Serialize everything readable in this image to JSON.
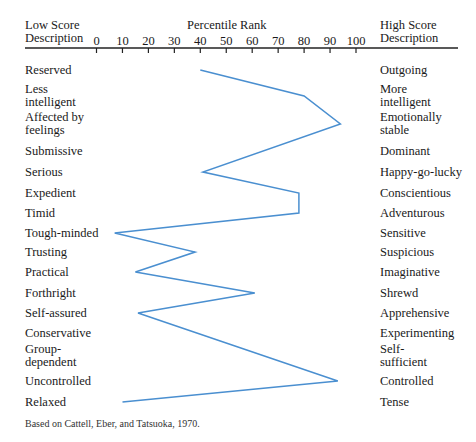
{
  "header": {
    "low_title_1": "Low Score",
    "low_title_2": "Description",
    "center_title": "Percentile Rank",
    "high_title_1": "High  Score",
    "high_title_2": "Description"
  },
  "footnote": "Based on Cattell, Eber, and Tatsuoka, 1970.",
  "chart_data": {
    "type": "line",
    "title": "Percentile Rank",
    "xlabel": "Percentile Rank",
    "ylabel": "",
    "xlim": [
      0,
      100
    ],
    "x_ticks": [
      "0",
      "10",
      "20",
      "30",
      "40",
      "50",
      "60",
      "70",
      "80",
      "90",
      "100"
    ],
    "orientation": "horizontal-profile",
    "grid": false,
    "legend": null,
    "line_color": "#4a8fd0",
    "traits": [
      {
        "low": "Reserved",
        "high": "Outgoing",
        "value": 40
      },
      {
        "low": "Less intelligent",
        "high": "More intelligent",
        "value": 80
      },
      {
        "low": "Affected by feelings",
        "high": "Emotionally stable",
        "value": 94
      },
      {
        "low": "Submissive",
        "high": "Dominant",
        "value": null
      },
      {
        "low": "Serious",
        "high": "Happy-go-lucky",
        "value": 41
      },
      {
        "low": "Expedient",
        "high": "Conscientious",
        "value": 78
      },
      {
        "low": "Timid",
        "high": "Adventurous",
        "value": 78
      },
      {
        "low": "Tough-minded",
        "high": "Sensitive",
        "value": 7
      },
      {
        "low": "Trusting",
        "high": "Suspicious",
        "value": 38
      },
      {
        "low": "Practical",
        "high": "Imaginative",
        "value": 15
      },
      {
        "low": "Forthright",
        "high": "Shrewd",
        "value": 61
      },
      {
        "low": "Self-assured",
        "high": "Apprehensive",
        "value": 16
      },
      {
        "low": "Conservative",
        "high": "Experimenting",
        "value": null
      },
      {
        "low": "Group-dependent",
        "high": "Self-sufficient",
        "value": null
      },
      {
        "low": "Uncontrolled",
        "high": "Controlled",
        "value": 93
      },
      {
        "low": "Relaxed",
        "high": "Tense",
        "value": 10
      }
    ],
    "annotations": [
      "Based on Cattell, Eber, and Tatsuoka, 1970."
    ]
  },
  "labels": {
    "left": [
      [
        "Reserved"
      ],
      [
        "Less",
        "intelligent"
      ],
      [
        "Affected by",
        "feelings"
      ],
      [
        "Submissive"
      ],
      [
        "Serious"
      ],
      [
        "Expedient"
      ],
      [
        "Timid"
      ],
      [
        "Tough-minded"
      ],
      [
        "Trusting"
      ],
      [
        "Practical"
      ],
      [
        "Forthright"
      ],
      [
        "Self-assured"
      ],
      [
        "Conservative"
      ],
      [
        "Group-",
        "dependent"
      ],
      [
        "Uncontrolled"
      ],
      [
        "Relaxed"
      ]
    ],
    "right": [
      [
        "Outgoing"
      ],
      [
        "More",
        "intelligent"
      ],
      [
        "Emotionally",
        "stable"
      ],
      [
        "Dominant"
      ],
      [
        "Happy-go-lucky"
      ],
      [
        "Conscientious"
      ],
      [
        "Adventurous"
      ],
      [
        "Sensitive"
      ],
      [
        "Suspicious"
      ],
      [
        "Imaginative"
      ],
      [
        "Shrewd"
      ],
      [
        "Apprehensive"
      ],
      [
        "Experimenting"
      ],
      [
        "Self-",
        "sufficient"
      ],
      [
        "Controlled"
      ],
      [
        "Tense"
      ]
    ]
  }
}
